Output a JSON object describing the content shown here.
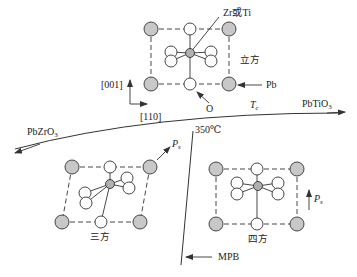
{
  "diagram": {
    "colors": {
      "line": "#333333",
      "pb_fill": "#c8c8c8",
      "o_fill": "#ffffff",
      "b_site_fill": "#b0b0b0",
      "background": "#ffffff"
    },
    "labels": {
      "b_site": "Zr或Ti",
      "cubic": "立方",
      "pb": "Pb",
      "oxygen": "O",
      "axis_001": "[001]",
      "axis_110": "[110]",
      "tc": "T",
      "tc_sub": "c",
      "pbtio3": "PbTiO",
      "pbtio3_sub": "3",
      "pbzro3": "PbZrO",
      "pbzro3_sub": "3",
      "temp": "350℃",
      "ps_rhombo": "P",
      "ps_rhombo_sub": "s",
      "ps_tetra": "P",
      "ps_tetra_sub": "s",
      "rhombohedral": "三方",
      "tetragonal": "四方",
      "mpb": "MPB"
    },
    "phases": [
      {
        "name": "cubic",
        "label": "立方",
        "polarization": "none"
      },
      {
        "name": "rhombohedral",
        "label": "三方",
        "polarization": "[111]"
      },
      {
        "name": "tetragonal",
        "label": "四方",
        "polarization": "[001]"
      }
    ],
    "boundaries": [
      {
        "name": "Curie temperature line",
        "label": "Tc"
      },
      {
        "name": "Morphotropic phase boundary",
        "label": "MPB"
      }
    ],
    "end_members": [
      "PbZrO3",
      "PbTiO3"
    ]
  }
}
